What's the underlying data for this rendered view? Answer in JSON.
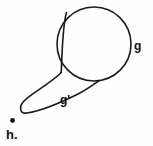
{
  "figure": {
    "background_color": "#fefefe",
    "stroke_color": "#1a1a1a",
    "width": 153,
    "height": 146,
    "labels": {
      "circle_label": "g",
      "loop_label": "g'",
      "point_label": "h."
    },
    "shapes": {
      "circle": {
        "name": "circle-curve-g",
        "center_x": 94,
        "center_y": 44,
        "radius": 37,
        "stroke_width": 1.6
      },
      "upper_tail": {
        "name": "upper-tail-curve",
        "path": "M 66.5 12.5 C 62.5 26 62.5 46 61.2 72.5",
        "stroke_width": 1.6
      },
      "loop": {
        "name": "cusp-loop-curve-g-prime",
        "path": "M 61.2 72.5 C 50 84 33 92 24.5 100.5 C 18 107 20 114 27 113 C 40 111 60 103 78 94 C 88 89 94 84 99.5 80.5",
        "stroke_width": 1.6
      },
      "point": {
        "name": "point-h",
        "x": 12.5,
        "y": 120.5,
        "radius": 2.4
      }
    },
    "label_positions": {
      "circle_label": {
        "x": 134,
        "y": 50
      },
      "loop_label": {
        "x": 60,
        "y": 104
      },
      "point_label": {
        "x": 6,
        "y": 139
      }
    }
  }
}
